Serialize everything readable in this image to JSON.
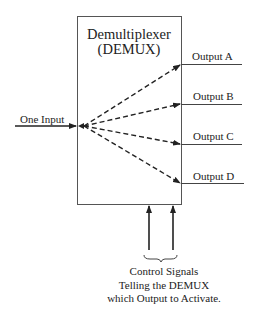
{
  "diagram": {
    "title_line1": "Demultiplexer",
    "title_line2": "(DEMUX)",
    "input_label": "One Input",
    "outputs": [
      {
        "label": "Output A"
      },
      {
        "label": "Output B"
      },
      {
        "label": "Output C"
      },
      {
        "label": "Output D"
      }
    ],
    "caption_lines": [
      "Control Signals",
      "Telling the DEMUX",
      "which Output to Activate."
    ],
    "colors": {
      "line": "#333333",
      "background": "#ffffff"
    }
  }
}
